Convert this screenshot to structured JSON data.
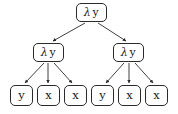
{
  "diagram": {
    "type": "lambda-term-tree",
    "background_color": "#ffffff",
    "stroke_color": "#2b2b2b",
    "text_color": "#1a1a1a",
    "lambda_symbol": "λ",
    "nodes": [
      {
        "id": "root",
        "role": "abstraction",
        "lambda": "λ",
        "binder": "y",
        "label": "λ y",
        "x": 76,
        "y": 3,
        "w": 31,
        "h": 19
      },
      {
        "id": "mid-left",
        "role": "abstraction",
        "lambda": "λ",
        "binder": "y",
        "label": "λ y",
        "x": 33,
        "y": 43,
        "w": 31,
        "h": 19
      },
      {
        "id": "mid-right",
        "role": "abstraction",
        "lambda": "λ",
        "binder": "y",
        "label": "λ y",
        "x": 113,
        "y": 43,
        "w": 31,
        "h": 19
      },
      {
        "id": "leaf-1",
        "role": "variable",
        "label": "y",
        "x": 10,
        "y": 85,
        "w": 23,
        "h": 21
      },
      {
        "id": "leaf-2",
        "role": "variable",
        "label": "x",
        "x": 37,
        "y": 85,
        "w": 23,
        "h": 21
      },
      {
        "id": "leaf-3",
        "role": "variable",
        "label": "x",
        "x": 64,
        "y": 85,
        "w": 23,
        "h": 21
      },
      {
        "id": "leaf-4",
        "role": "variable",
        "label": "y",
        "x": 91,
        "y": 85,
        "w": 23,
        "h": 21
      },
      {
        "id": "leaf-5",
        "role": "variable",
        "label": "x",
        "x": 118,
        "y": 85,
        "w": 23,
        "h": 21
      },
      {
        "id": "leaf-6",
        "role": "variable",
        "label": "x",
        "x": 145,
        "y": 85,
        "w": 23,
        "h": 21
      }
    ],
    "edges": [
      {
        "id": "edge-root-midleft",
        "from": "root",
        "to": "mid-left",
        "x1": 85,
        "y1": 23,
        "x2": 53,
        "y2": 41
      },
      {
        "id": "edge-root-midright",
        "from": "root",
        "to": "mid-right",
        "x1": 98,
        "y1": 23,
        "x2": 126,
        "y2": 41
      },
      {
        "id": "edge-midleft-leaf1",
        "from": "mid-left",
        "to": "leaf-1",
        "x1": 44,
        "y1": 63,
        "x2": 25,
        "y2": 83
      },
      {
        "id": "edge-midleft-leaf2",
        "from": "mid-left",
        "to": "leaf-2",
        "x1": 48,
        "y1": 63,
        "x2": 48,
        "y2": 83
      },
      {
        "id": "edge-midleft-leaf3",
        "from": "mid-left",
        "to": "leaf-3",
        "x1": 54,
        "y1": 63,
        "x2": 72,
        "y2": 83
      },
      {
        "id": "edge-midright-leaf4",
        "from": "mid-right",
        "to": "leaf-4",
        "x1": 124,
        "y1": 63,
        "x2": 106,
        "y2": 83
      },
      {
        "id": "edge-midright-leaf5",
        "from": "mid-right",
        "to": "leaf-5",
        "x1": 129,
        "y1": 63,
        "x2": 129,
        "y2": 83
      },
      {
        "id": "edge-midright-leaf6",
        "from": "mid-right",
        "to": "leaf-6",
        "x1": 135,
        "y1": 63,
        "x2": 153,
        "y2": 83
      }
    ]
  }
}
